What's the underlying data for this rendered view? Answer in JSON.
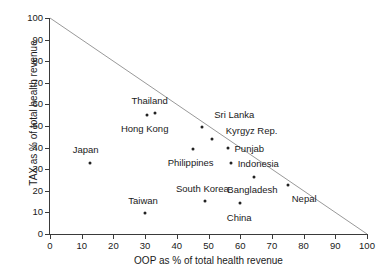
{
  "chart_data": {
    "type": "scatter",
    "title": "",
    "xlabel": "OOP as % of total health revenue",
    "ylabel": "TAX as % of total health revenue",
    "xlim": [
      0,
      100
    ],
    "ylim": [
      0,
      100
    ],
    "xticks": [
      0,
      10,
      20,
      30,
      40,
      50,
      60,
      70,
      80,
      90,
      100
    ],
    "yticks": [
      0,
      10,
      20,
      30,
      40,
      50,
      60,
      70,
      80,
      90,
      100
    ],
    "grid": false,
    "legend": false,
    "annotations": [
      {
        "label": "Reference line",
        "type": "line",
        "from": [
          0,
          100
        ],
        "to": [
          100,
          0
        ],
        "color": "#999999"
      }
    ],
    "points": [
      {
        "name": "Japan",
        "x": 12.5,
        "y": 33.0,
        "label_dx": -4,
        "label_dy": -13,
        "label_anchor": "middle"
      },
      {
        "name": "Hong Kong",
        "x": 30.5,
        "y": 55.0,
        "label_dx": -2,
        "label_dy": 14,
        "label_anchor": "middle"
      },
      {
        "name": "Thailand",
        "x": 33.0,
        "y": 56.0,
        "label_dx": -5,
        "label_dy": -12,
        "label_anchor": "middle"
      },
      {
        "name": "Taiwan",
        "x": 30.0,
        "y": 9.5,
        "label_dx": -2,
        "label_dy": -12,
        "label_anchor": "middle"
      },
      {
        "name": "Philippines",
        "x": 45.0,
        "y": 39.5,
        "label_dx": -2,
        "label_dy": 14,
        "label_anchor": "middle"
      },
      {
        "name": "South Korea",
        "x": 49.0,
        "y": 15.5,
        "label_dx": -3,
        "label_dy": -12,
        "label_anchor": "middle"
      },
      {
        "name": "Sri Lanka",
        "x": 48.0,
        "y": 49.5,
        "label_dx": 12,
        "label_dy": -12,
        "label_anchor": "start"
      },
      {
        "name": "Kyrgyz Rep.",
        "x": 51.0,
        "y": 44.0,
        "label_dx": 14,
        "label_dy": -8,
        "label_anchor": "start"
      },
      {
        "name": "Punjab",
        "x": 56.0,
        "y": 40.0,
        "label_dx": 7,
        "label_dy": 1,
        "label_anchor": "start"
      },
      {
        "name": "Indonesia",
        "x": 57.0,
        "y": 33.0,
        "label_dx": 7,
        "label_dy": 1,
        "label_anchor": "start"
      },
      {
        "name": "Bangladesh",
        "x": 64.5,
        "y": 26.5,
        "label_dx": -2,
        "label_dy": 13,
        "label_anchor": "middle"
      },
      {
        "name": "China",
        "x": 60.0,
        "y": 14.5,
        "label_dx": -1,
        "label_dy": 15,
        "label_anchor": "middle"
      },
      {
        "name": "Nepal",
        "x": 75.0,
        "y": 22.5,
        "label_dx": 4,
        "label_dy": 14,
        "label_anchor": "start"
      }
    ]
  }
}
